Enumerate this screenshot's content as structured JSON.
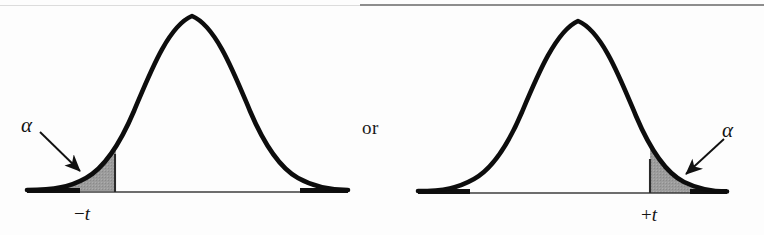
{
  "figure": {
    "name": "two-tailed-t-test-critical-regions",
    "background_color": "#fdfdfd",
    "ink_color": "#111111",
    "shade_color": "#9a9a9a",
    "connector_text": "or"
  },
  "left_panel": {
    "alpha_label": "α",
    "axis_label_sign": "−",
    "axis_label_symbol": "t",
    "axis_label": "−t",
    "tail": "left",
    "critical_line_x": 115
  },
  "right_panel": {
    "alpha_label": "α",
    "axis_label_sign": "+",
    "axis_label_symbol": "t",
    "axis_label": "+t",
    "tail": "right",
    "critical_line_x": 650
  },
  "chart_data": {
    "type": "line",
    "title": "",
    "subtitle": "",
    "xlabel": "",
    "ylabel": "",
    "grid": false,
    "legend": "none",
    "curves": [
      {
        "name": "left-distribution",
        "distribution": "normal",
        "mean": 0,
        "sd": 1,
        "x": [
          -3.5,
          -3,
          -2.5,
          -2,
          -1.5,
          -1,
          -0.5,
          0,
          0.5,
          1,
          1.5,
          2,
          2.5,
          3,
          3.5
        ],
        "y": [
          0.0009,
          0.0044,
          0.0175,
          0.054,
          0.1295,
          0.242,
          0.3521,
          0.3989,
          0.3521,
          0.242,
          0.1295,
          0.054,
          0.0175,
          0.0044,
          0.0009
        ],
        "shaded_region": {
          "label": "α",
          "from": -3.5,
          "to": -1.7,
          "side": "lower-tail",
          "fill": "#9a9a9a"
        },
        "markers": [
          {
            "label": "−t",
            "x": -1.7
          }
        ]
      },
      {
        "name": "right-distribution",
        "distribution": "normal",
        "mean": 0,
        "sd": 1,
        "x": [
          -3.5,
          -3,
          -2.5,
          -2,
          -1.5,
          -1,
          -0.5,
          0,
          0.5,
          1,
          1.5,
          2,
          2.5,
          3,
          3.5
        ],
        "y": [
          0.0009,
          0.0044,
          0.0175,
          0.054,
          0.1295,
          0.242,
          0.3521,
          0.3989,
          0.3521,
          0.242,
          0.1295,
          0.054,
          0.0175,
          0.0044,
          0.0009
        ],
        "shaded_region": {
          "label": "α",
          "from": 1.7,
          "to": 3.5,
          "side": "upper-tail",
          "fill": "#9a9a9a"
        },
        "markers": [
          {
            "label": "+t",
            "x": 1.7
          }
        ]
      }
    ],
    "annotations": [
      {
        "text": "α",
        "target": "left lower tail shaded area",
        "arrow": true
      },
      {
        "text": "or",
        "target": "between the two panels",
        "arrow": false
      },
      {
        "text": "α",
        "target": "right upper tail shaded area",
        "arrow": true
      }
    ]
  }
}
